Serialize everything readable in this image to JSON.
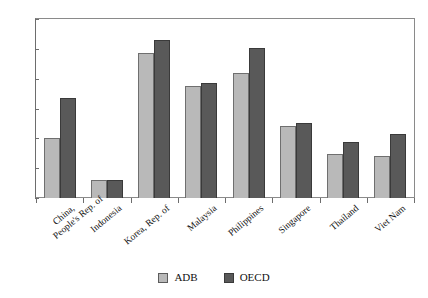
{
  "chart_data": {
    "type": "bar",
    "title": "",
    "xlabel": "",
    "ylabel": "",
    "ylim": [
      0,
      30
    ],
    "ytick_labels": [
      "30",
      "25",
      "20",
      "15",
      "10",
      "5",
      "0"
    ],
    "ytick_values": [
      30,
      25,
      20,
      15,
      10,
      5,
      0
    ],
    "grid": false,
    "legend_position": "bottom-center",
    "categories": [
      "China,\nPeople's Rep. of",
      "Indonesia",
      "Korea, Rep. of",
      "Malaysia",
      "Philippines",
      "Singapore",
      "Thailand",
      "Viet Nam"
    ],
    "series": [
      {
        "name": "ADB",
        "color": "#b9b9b9",
        "values": [
          10.0,
          3.1,
          24.3,
          18.7,
          20.9,
          12.1,
          7.3,
          7.1
        ]
      },
      {
        "name": "OECD",
        "color": "#595959",
        "values": [
          16.8,
          3.0,
          26.5,
          19.3,
          25.2,
          12.5,
          9.4,
          10.8
        ]
      }
    ]
  },
  "legend": {
    "items": [
      {
        "label": "ADB",
        "swatch": "adb"
      },
      {
        "label": "OECD",
        "swatch": "oecd"
      }
    ]
  }
}
